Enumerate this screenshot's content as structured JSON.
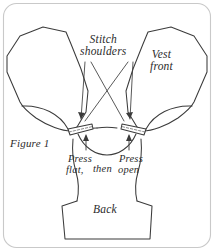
{
  "figure": {
    "caption": "Figure 1",
    "background_color": "#ffffff",
    "line_color": "#3a3a3a",
    "border_color": "#c8c8c8",
    "labels": {
      "stitch_line1": "Stitch",
      "stitch_line2": "shoulders",
      "vest_line1": "Vest",
      "vest_line2": "front",
      "press_left_line1": "Press",
      "press_left_line2": "flat,",
      "then": "then",
      "press_right_line1": "Press",
      "press_right_line2": "open",
      "back": "Back"
    },
    "pieces": [
      {
        "name": "left-vest-front",
        "label": ""
      },
      {
        "name": "right-vest-front",
        "label": "Vest front"
      },
      {
        "name": "back-bodice",
        "label": "Back"
      }
    ],
    "annotations": [
      {
        "name": "stitch-shoulders-callout",
        "text": "Stitch shoulders",
        "targets": [
          "left-shoulder-seam",
          "right-shoulder-seam"
        ]
      },
      {
        "name": "press-flat-callout",
        "text": "Press flat,"
      },
      {
        "name": "press-open-callout",
        "text": "Press open"
      }
    ]
  }
}
